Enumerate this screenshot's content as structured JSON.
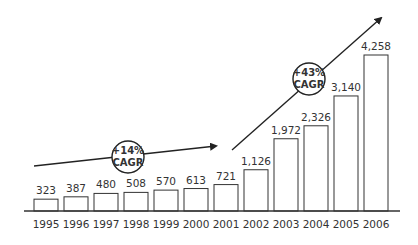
{
  "chart_data": {
    "type": "bar",
    "title": "",
    "xlabel": "",
    "ylabel": "",
    "categories": [
      "1995",
      "1996",
      "1997",
      "1998",
      "1999",
      "2000",
      "2001",
      "2002",
      "2003",
      "2004",
      "2005",
      "2006"
    ],
    "values": [
      323,
      387,
      480,
      508,
      570,
      613,
      721,
      1126,
      1972,
      2326,
      3140,
      4258
    ],
    "value_labels": [
      "323",
      "387",
      "480",
      "508",
      "570",
      "613",
      "721",
      "1,126",
      "1,972",
      "2,326",
      "3,140",
      "4,258"
    ],
    "grid": false,
    "legend": null,
    "bar_style": {
      "fill": "#ffffff",
      "stroke": "#333333"
    },
    "annotations": [
      {
        "type": "trend-arrow",
        "label_line1": "+14%",
        "label_line2": "CAGR",
        "from": "1995",
        "to": "2001"
      },
      {
        "type": "trend-arrow",
        "label_line1": "+43%",
        "label_line2": "CAGR",
        "from": "2002",
        "to": "2006"
      }
    ]
  }
}
